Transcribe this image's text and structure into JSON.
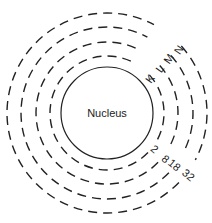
{
  "diagram": {
    "nucleus": {
      "label": "Nucleus",
      "cx": 107,
      "cy": 113,
      "r": 46
    },
    "shells": [
      {
        "name": "K",
        "capacity": "2",
        "r": 57
      },
      {
        "name": "L",
        "capacity": "8",
        "r": 71
      },
      {
        "name": "M",
        "capacity": "18",
        "r": 86
      },
      {
        "name": "N",
        "capacity": "32",
        "r": 100
      }
    ],
    "shell_labels": [
      {
        "text": "K",
        "x": 153,
        "y": 81,
        "rot": -55
      },
      {
        "text": "L",
        "x": 163,
        "y": 71,
        "rot": -55
      },
      {
        "text": "M",
        "x": 172,
        "y": 61,
        "rot": -55
      },
      {
        "text": "N",
        "x": 182,
        "y": 52,
        "rot": -55
      }
    ],
    "capacity_labels": [
      {
        "text": "2",
        "x": 152,
        "y": 152,
        "rot": 40
      },
      {
        "text": "8",
        "x": 163,
        "y": 162,
        "rot": 40
      },
      {
        "text": "18",
        "x": 172,
        "y": 168,
        "rot": 40
      },
      {
        "text": "32",
        "x": 186,
        "y": 178,
        "rot": 40
      }
    ],
    "colors": {
      "stroke": "#222222",
      "background": "#ffffff"
    }
  }
}
